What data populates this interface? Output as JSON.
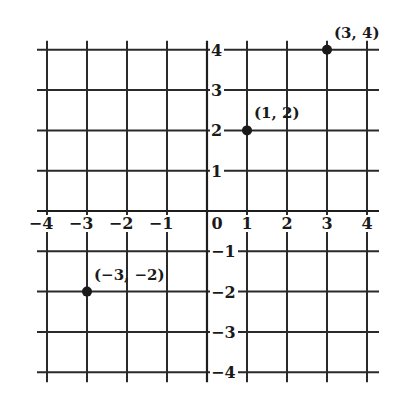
{
  "chart_data": {
    "type": "scatter",
    "title": "",
    "xlabel": "",
    "ylabel": "",
    "xlim": [
      -4,
      4
    ],
    "ylim": [
      -4,
      4
    ],
    "grid": true,
    "x_ticks": [
      -4,
      -3,
      -2,
      -1,
      0,
      1,
      2,
      3,
      4
    ],
    "y_ticks": [
      -4,
      -3,
      -2,
      -1,
      1,
      2,
      3,
      4
    ],
    "x_tick_labels": [
      "−4",
      "−3",
      "−2",
      "−1",
      "0",
      "1",
      "2",
      "3",
      "4"
    ],
    "y_tick_labels": [
      "−4",
      "−3",
      "−2",
      "−1",
      "1",
      "2",
      "3",
      "4"
    ],
    "points": [
      {
        "x": 3,
        "y": 4,
        "label": "(3, 4)"
      },
      {
        "x": 1,
        "y": 2,
        "label": "(1, 2)"
      },
      {
        "x": -3,
        "y": -2,
        "label": "(−3, −2)"
      }
    ],
    "colors": {
      "ink": "#1a1a1a",
      "background": "#ffffff"
    }
  }
}
